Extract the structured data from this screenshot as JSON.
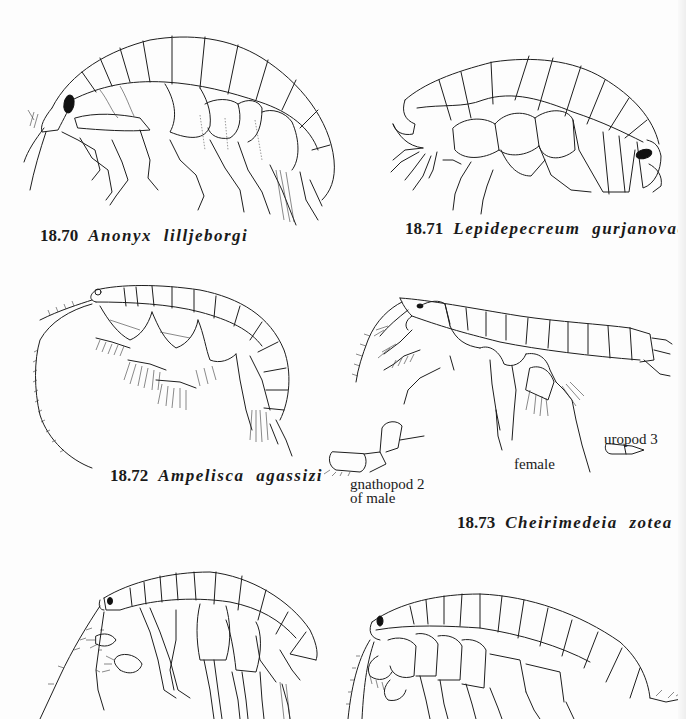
{
  "page": {
    "background": "#fdfdfd",
    "ink_color": "#1e1e1e"
  },
  "figures": [
    {
      "id": "18.70",
      "number": "18.70",
      "species": "Anonyx lilljeborgi",
      "icon": "amphipod-drawing"
    },
    {
      "id": "18.71",
      "number": "18.71",
      "species": "Lepidepecreum gurjanovae",
      "icon": "amphipod-drawing"
    },
    {
      "id": "18.72",
      "number": "18.72",
      "species": "Ampelisca agassizi",
      "icon": "amphipod-drawing"
    },
    {
      "id": "18.73",
      "number": "18.73",
      "species": "Cheirimedeia zotea",
      "icon": "amphipod-drawing",
      "annotations": {
        "female": "female",
        "uropod": "uropod 3",
        "gnathopod_line1": "gnathopod 2",
        "gnathopod_line2": "of male"
      }
    },
    {
      "id": "18.74-partial",
      "number": "",
      "species": "",
      "icon": "amphipod-drawing"
    },
    {
      "id": "18.75-partial",
      "number": "",
      "species": "",
      "icon": "amphipod-drawing"
    }
  ]
}
